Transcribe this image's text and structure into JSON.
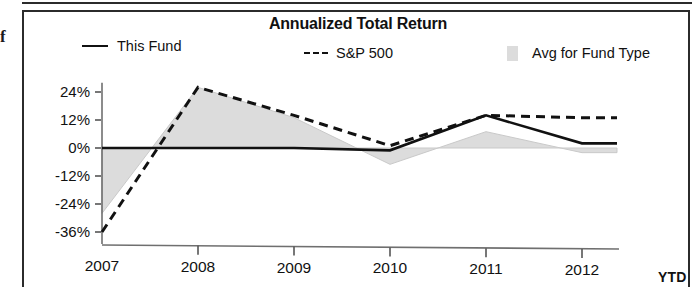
{
  "stray_glyph": "f",
  "chart_data": {
    "type": "area",
    "title": "Annualized Total Return",
    "xlabel": "",
    "ylabel": "",
    "grid": false,
    "legend_position": "top",
    "ylim": [
      -40,
      28
    ],
    "yticks": [
      24,
      12,
      0,
      -12,
      -24,
      -36
    ],
    "ytick_labels": [
      "24%",
      "12%",
      "0%",
      "-12%",
      "-24%",
      "-36%"
    ],
    "categories": [
      "2007",
      "2008",
      "2009",
      "2010",
      "2011",
      "2012"
    ],
    "x_axis_suffix_label": "YTD",
    "series": [
      {
        "name": "This Fund",
        "style": "solid",
        "color": "#111111",
        "values": [
          0,
          0,
          0,
          0,
          0,
          0
        ]
      },
      {
        "name": "S&P 500",
        "style": "dashed",
        "color": "#111111",
        "values": [
          -36,
          26,
          14,
          1,
          14,
          13
        ]
      },
      {
        "name": "Avg for Fund Type",
        "style": "area",
        "color": "#dcdcdc",
        "values": [
          -28,
          26,
          13,
          -7,
          7,
          -2
        ]
      }
    ],
    "annotations": [
      "This Fund line is flat at 0% across 2007-2010, rises to 14% at 2011, then declines to 2% at 2012 YTD"
    ],
    "this_fund_path": [
      {
        "x": "2007",
        "y": 0
      },
      {
        "x": "2008",
        "y": 0
      },
      {
        "x": "2009",
        "y": 0
      },
      {
        "x": "2010",
        "y": -1
      },
      {
        "x": "2011",
        "y": 14
      },
      {
        "x": "2012",
        "y": 2
      }
    ]
  },
  "legend": {
    "this_fund": "This Fund",
    "sp500": "S&P 500",
    "avg_for_fund_type": "Avg for Fund Type"
  }
}
